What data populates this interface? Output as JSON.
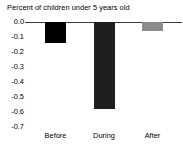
{
  "chart_data": {
    "type": "bar",
    "title": "Percent of children under 5 years old",
    "xlabel": "",
    "ylabel": "",
    "categories": [
      "Before",
      "During",
      "After"
    ],
    "values": [
      -0.14,
      -0.58,
      -0.06
    ],
    "series": [
      {
        "name": "Percent of children under 5 years old",
        "values": [
          -0.14,
          -0.58,
          -0.06
        ]
      }
    ],
    "bar_colors": [
      "#000000",
      "#1f1f1f",
      "#8c8c8c"
    ],
    "ylim": [
      -0.7,
      0.0
    ],
    "ytick_labels": [
      "0.0",
      "-0.1",
      "-0.2",
      "-0.3",
      "-0.4",
      "-0.5",
      "-0.6",
      "-0.7"
    ],
    "ytick_values": [
      0.0,
      -0.1,
      -0.2,
      -0.3,
      -0.4,
      -0.5,
      -0.6,
      -0.7
    ],
    "grid": false,
    "legend": "none",
    "zero_line_color": "#3a3a3a",
    "background": "#ffffff"
  }
}
